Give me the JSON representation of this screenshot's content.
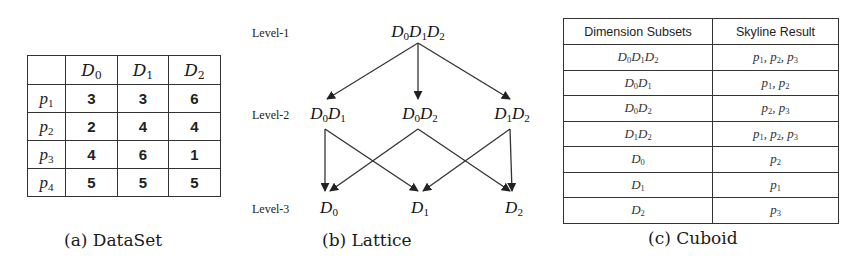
{
  "dataset": {
    "caption": "(a) DataSet",
    "columns": [
      {
        "base": "D",
        "sub": "0"
      },
      {
        "base": "D",
        "sub": "1"
      },
      {
        "base": "D",
        "sub": "2"
      }
    ],
    "rows": [
      {
        "point": {
          "base": "p",
          "sub": "1"
        },
        "values": [
          "3",
          "3",
          "6"
        ]
      },
      {
        "point": {
          "base": "p",
          "sub": "2"
        },
        "values": [
          "2",
          "4",
          "4"
        ]
      },
      {
        "point": {
          "base": "p",
          "sub": "3"
        },
        "values": [
          "4",
          "6",
          "1"
        ]
      },
      {
        "point": {
          "base": "p",
          "sub": "4"
        },
        "values": [
          "5",
          "5",
          "5"
        ]
      }
    ]
  },
  "lattice": {
    "caption": "(b) Lattice",
    "levels": [
      "Level-1",
      "Level-2",
      "Level-3"
    ],
    "nodes": {
      "l1": [
        {
          "id": "D0D1D2",
          "parts": [
            [
              "D",
              "0"
            ],
            [
              "D",
              "1"
            ],
            [
              "D",
              "2"
            ]
          ]
        }
      ],
      "l2": [
        {
          "id": "D0D1",
          "parts": [
            [
              "D",
              "0"
            ],
            [
              "D",
              "1"
            ]
          ]
        },
        {
          "id": "D0D2",
          "parts": [
            [
              "D",
              "0"
            ],
            [
              "D",
              "2"
            ]
          ]
        },
        {
          "id": "D1D2",
          "parts": [
            [
              "D",
              "1"
            ],
            [
              "D",
              "2"
            ]
          ]
        }
      ],
      "l3": [
        {
          "id": "D0",
          "parts": [
            [
              "D",
              "0"
            ]
          ]
        },
        {
          "id": "D1",
          "parts": [
            [
              "D",
              "1"
            ]
          ]
        },
        {
          "id": "D2",
          "parts": [
            [
              "D",
              "2"
            ]
          ]
        }
      ]
    },
    "edges": [
      [
        "D0D1D2",
        "D0D1"
      ],
      [
        "D0D1D2",
        "D0D2"
      ],
      [
        "D0D1D2",
        "D1D2"
      ],
      [
        "D0D1",
        "D0"
      ],
      [
        "D0D1",
        "D1"
      ],
      [
        "D0D2",
        "D0"
      ],
      [
        "D0D2",
        "D2"
      ],
      [
        "D1D2",
        "D1"
      ],
      [
        "D1D2",
        "D2"
      ]
    ]
  },
  "cuboid": {
    "caption": "(c) Cuboid",
    "headers": [
      "Dimension Subsets",
      "Skyline Result"
    ],
    "rows": [
      {
        "subset": [
          [
            "D",
            "0"
          ],
          [
            "D",
            "1"
          ],
          [
            "D",
            "2"
          ]
        ],
        "result": [
          [
            "p",
            "1"
          ],
          [
            "p",
            "2"
          ],
          [
            "p",
            "3"
          ]
        ]
      },
      {
        "subset": [
          [
            "D",
            "0"
          ],
          [
            "D",
            "1"
          ]
        ],
        "result": [
          [
            "p",
            "1"
          ],
          [
            "p",
            "2"
          ]
        ]
      },
      {
        "subset": [
          [
            "D",
            "0"
          ],
          [
            "D",
            "2"
          ]
        ],
        "result": [
          [
            "p",
            "2"
          ],
          [
            "p",
            "3"
          ]
        ]
      },
      {
        "subset": [
          [
            "D",
            "1"
          ],
          [
            "D",
            "2"
          ]
        ],
        "result": [
          [
            "p",
            "1"
          ],
          [
            "p",
            "2"
          ],
          [
            "p",
            "3"
          ]
        ]
      },
      {
        "subset": [
          [
            "D",
            "0"
          ]
        ],
        "result": [
          [
            "p",
            "2"
          ]
        ]
      },
      {
        "subset": [
          [
            "D",
            "1"
          ]
        ],
        "result": [
          [
            "p",
            "1"
          ]
        ]
      },
      {
        "subset": [
          [
            "D",
            "2"
          ]
        ],
        "result": [
          [
            "p",
            "3"
          ]
        ]
      }
    ]
  }
}
